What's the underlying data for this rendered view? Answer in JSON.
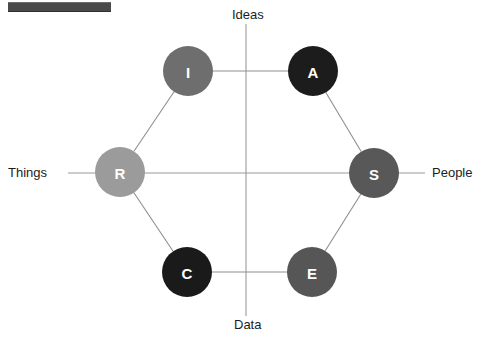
{
  "figure": {
    "top_bar_color": "#4a4a4a",
    "background_color": "#ffffff"
  },
  "axes": {
    "vertical": {
      "top_label": "Ideas",
      "bottom_label": "Data"
    },
    "horizontal": {
      "left_label": "Things",
      "right_label": "People"
    }
  },
  "chart_data": {
    "type": "scatter",
    "xlabel": "Things — People",
    "ylabel": "Data — Ideas",
    "xlim": [
      0,
      491
    ],
    "ylim": [
      0,
      343
    ],
    "grid": false,
    "legend": "none",
    "annotations": [
      "Ideas",
      "Data",
      "Things",
      "People"
    ],
    "nodes": [
      {
        "id": "I",
        "label": "I",
        "name": "Investigative",
        "cx": 188,
        "cy": 71,
        "r": 25,
        "color": "#6e6e6e",
        "text_color": "#ffffff"
      },
      {
        "id": "A",
        "label": "A",
        "name": "Artistic",
        "cx": 313,
        "cy": 71,
        "r": 25,
        "color": "#1c1c1c",
        "text_color": "#ffffff"
      },
      {
        "id": "S",
        "label": "S",
        "name": "Social",
        "cx": 374,
        "cy": 173,
        "r": 25,
        "color": "#585858",
        "text_color": "#ffffff"
      },
      {
        "id": "E",
        "label": "E",
        "name": "Enterprising",
        "cx": 312,
        "cy": 272,
        "r": 25,
        "color": "#565656",
        "text_color": "#ffffff"
      },
      {
        "id": "C",
        "label": "C",
        "name": "Conventional",
        "cx": 187,
        "cy": 272,
        "r": 25,
        "color": "#1a1a1a",
        "text_color": "#ffffff"
      },
      {
        "id": "R",
        "label": "R",
        "name": "Realistic",
        "cx": 120,
        "cy": 172,
        "r": 25,
        "color": "#9b9b9b",
        "text_color": "#ffffff"
      }
    ],
    "edges": [
      {
        "from": "I",
        "to": "A"
      },
      {
        "from": "A",
        "to": "S"
      },
      {
        "from": "S",
        "to": "E"
      },
      {
        "from": "E",
        "to": "C"
      },
      {
        "from": "C",
        "to": "R"
      },
      {
        "from": "R",
        "to": "I"
      }
    ],
    "axis_lines": [
      {
        "name": "vertical",
        "x1": 246,
        "y1": 24,
        "x2": 246,
        "y2": 316
      },
      {
        "name": "horizontal",
        "x1": 68,
        "y1": 173,
        "x2": 425,
        "y2": 173
      }
    ]
  }
}
